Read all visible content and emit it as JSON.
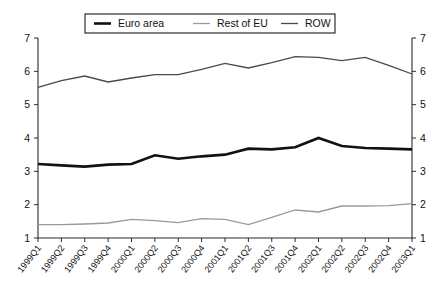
{
  "chart_data": {
    "type": "line",
    "title": "",
    "xlabel": "",
    "ylabel": "",
    "ylim": [
      1,
      7
    ],
    "yticks": [
      1,
      2,
      3,
      4,
      5,
      6,
      7
    ],
    "grid": false,
    "dual_y_axis": true,
    "legend_position": "top-center",
    "categories": [
      "1999Q1",
      "1999Q2",
      "1999Q3",
      "1999Q4",
      "2000Q1",
      "2000Q2",
      "2000Q3",
      "2000Q4",
      "2001Q1",
      "2001Q2",
      "2001Q3",
      "2001Q4",
      "2002Q1",
      "2002Q2",
      "2002Q3",
      "2002Q4",
      "2003Q1"
    ],
    "series": [
      {
        "name": "Euro area",
        "color": "#111111",
        "width": 2.6,
        "values": [
          3.22,
          3.18,
          3.14,
          3.2,
          3.22,
          3.48,
          3.38,
          3.45,
          3.5,
          3.68,
          3.66,
          3.72,
          4.0,
          3.76,
          3.7,
          3.68,
          3.66
        ]
      },
      {
        "name": "Rest of EU",
        "color": "#9a9a9a",
        "width": 1.3,
        "values": [
          1.4,
          1.4,
          1.42,
          1.45,
          1.56,
          1.52,
          1.46,
          1.58,
          1.56,
          1.4,
          1.62,
          1.84,
          1.78,
          1.96,
          1.96,
          1.97,
          2.03
        ]
      },
      {
        "name": "ROW",
        "color": "#4a4a4a",
        "width": 1.3,
        "values": [
          5.52,
          5.72,
          5.86,
          5.68,
          5.8,
          5.9,
          5.9,
          6.06,
          6.24,
          6.1,
          6.26,
          6.44,
          6.42,
          6.32,
          6.42,
          6.18,
          5.92
        ]
      }
    ]
  },
  "legend": {
    "entries": [
      {
        "label": "Euro area"
      },
      {
        "label": "Rest of EU"
      },
      {
        "label": "ROW"
      }
    ]
  }
}
